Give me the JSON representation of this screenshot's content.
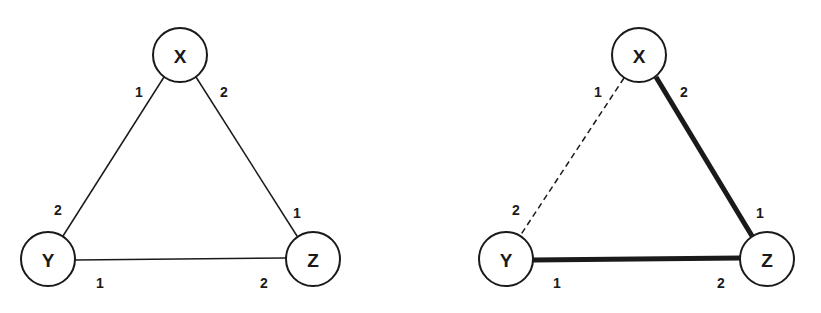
{
  "diagrams": [
    {
      "id": "left",
      "nodes": [
        {
          "label": "X",
          "cx": 180,
          "cy": 55,
          "r": 27
        },
        {
          "label": "Y",
          "cx": 48,
          "cy": 259,
          "r": 27
        },
        {
          "label": "Z",
          "cx": 313,
          "cy": 259,
          "r": 27
        }
      ],
      "edges": [
        {
          "from": "X",
          "to": "Y",
          "style": "thin"
        },
        {
          "from": "X",
          "to": "Z",
          "style": "thin"
        },
        {
          "from": "Y",
          "to": "Z",
          "style": "thin"
        }
      ],
      "port_labels": [
        {
          "text": "1",
          "x": 139,
          "y": 92
        },
        {
          "text": "2",
          "x": 224,
          "y": 92
        },
        {
          "text": "2",
          "x": 58,
          "y": 210
        },
        {
          "text": "1",
          "x": 297,
          "y": 213
        },
        {
          "text": "1",
          "x": 100,
          "y": 283
        },
        {
          "text": "2",
          "x": 264,
          "y": 283
        }
      ]
    },
    {
      "id": "right",
      "nodes": [
        {
          "label": "X",
          "cx": 639,
          "cy": 55,
          "r": 27
        },
        {
          "label": "Y",
          "cx": 506,
          "cy": 259,
          "r": 27
        },
        {
          "label": "Z",
          "cx": 767,
          "cy": 259,
          "r": 27
        }
      ],
      "edges": [
        {
          "from": "X",
          "to": "Y",
          "style": "dashed"
        },
        {
          "from": "X",
          "to": "Z",
          "style": "thick"
        },
        {
          "from": "Y",
          "to": "Z",
          "style": "thick"
        }
      ],
      "port_labels": [
        {
          "text": "1",
          "x": 598,
          "y": 92
        },
        {
          "text": "2",
          "x": 684,
          "y": 92
        },
        {
          "text": "2",
          "x": 516,
          "y": 210
        },
        {
          "text": "1",
          "x": 760,
          "y": 213
        },
        {
          "text": "1",
          "x": 557,
          "y": 283
        },
        {
          "text": "2",
          "x": 721,
          "y": 283
        }
      ]
    }
  ]
}
